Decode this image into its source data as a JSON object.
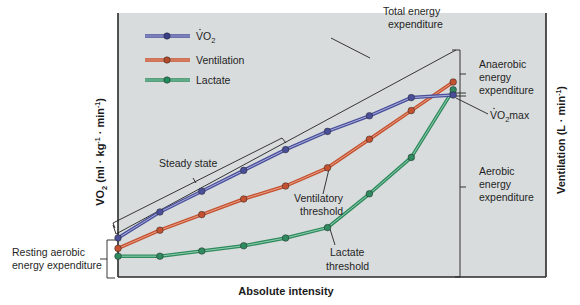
{
  "chart_data": {
    "type": "line",
    "title": "",
    "xlabel": "Absolute intensity",
    "ylabel_left": "V̇O₂ (ml · kg⁻¹ · min⁻¹)",
    "ylabel_right": "Ventilation (L · min⁻¹)",
    "grid": false,
    "legend_position": "top-left",
    "x": [
      1,
      2,
      3,
      4,
      5,
      6,
      7,
      8,
      9
    ],
    "series": [
      {
        "name": "V̇O₂",
        "color": "#4a4f9a",
        "values": [
          15,
          25,
          33,
          41,
          49,
          56,
          62,
          69,
          70
        ]
      },
      {
        "name": "Ventilation",
        "color": "#c4512f",
        "values": [
          11,
          18,
          24,
          30,
          35,
          42,
          53,
          64,
          75
        ]
      },
      {
        "name": "Lactate",
        "color": "#2f8a5f",
        "values": [
          8,
          8,
          10,
          12,
          15,
          19,
          32,
          46,
          72
        ]
      }
    ],
    "annotations": [
      "Total energy expenditure",
      "Anaerobic energy expenditure",
      "V̇O₂max",
      "Steady state",
      "Ventilatory threshold",
      "Aerobic energy expenditure",
      "Resting aerobic energy expenditure",
      "Lactate threshold"
    ]
  },
  "legend": {
    "vo2": {
      "label_main": "VO",
      "label_sub": "2"
    },
    "ventilation": {
      "label": "Ventilation"
    },
    "lactate": {
      "label": "Lactate"
    }
  },
  "labels": {
    "total_energy_1": "Total energy",
    "total_energy_2": "expenditure",
    "anaerobic_1": "Anaerobic",
    "anaerobic_2": "energy",
    "anaerobic_3": "expenditure",
    "vo2max_main": "VO",
    "vo2max_sub": "2",
    "vo2max_tail": "max",
    "steady_state": "Steady state",
    "ventilatory_1": "Ventilatory",
    "ventilatory_2": "threshold",
    "aerobic_1": "Aerobic",
    "aerobic_2": "energy",
    "aerobic_3": "expenditure",
    "resting_1": "Resting aerobic",
    "resting_2": "energy expenditure",
    "lactate_1": "Lactate",
    "lactate_2": "threshold",
    "x_axis": "Absolute intensity",
    "y_left_main": "VO",
    "y_left_sub": "2",
    "y_left_tail": " (ml · kg",
    "y_left_sup1": "-1",
    "y_left_mid": " · min",
    "y_left_sup2": "-1",
    "y_left_end": ")",
    "y_right_main": "Ventilation (L · min",
    "y_right_sup": "-1",
    "y_right_end": ")"
  },
  "colors": {
    "plot_bg": "#d9dcdd",
    "vo2": "#4a4f9a",
    "ventilation": "#c4512f",
    "lactate": "#2f8a5f",
    "axis": "#2a2a2a"
  }
}
